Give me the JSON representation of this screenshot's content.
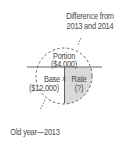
{
  "diagram": {
    "type": "portion-base-rate-circle",
    "annotation_top": {
      "line1": "Difference from",
      "line2": "2013 and 2014"
    },
    "annotation_bottom": "Old year—2013",
    "portion": {
      "label": "Portion",
      "value": "($4,000)"
    },
    "base": {
      "label": "Base",
      "value": "($12,000)"
    },
    "operator": "×",
    "rate": {
      "label": "Rate",
      "value": "(?)"
    },
    "colors": {
      "stroke": "#555555",
      "text": "#4a4a4a",
      "rate_fill": "#d9d9d9"
    }
  }
}
